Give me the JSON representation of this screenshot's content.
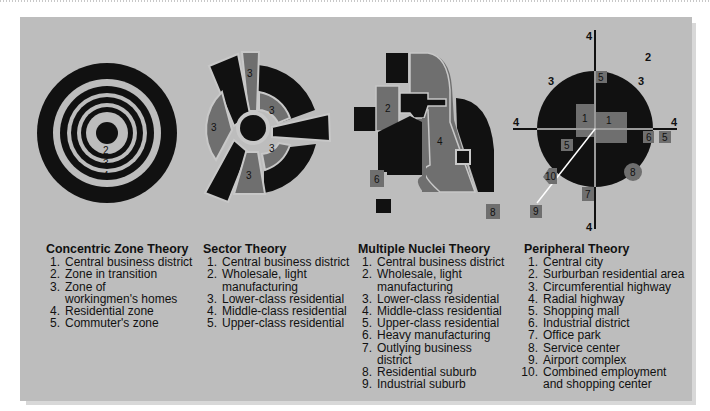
{
  "colors": {
    "panel_bg": "#bdbdbd",
    "dark": "#111111",
    "mid": "#6f6f6f",
    "light_line": "#c8c8c8"
  },
  "diagrams": {
    "concentric": {
      "labels": [
        "1",
        "2",
        "3",
        "4",
        "5"
      ]
    },
    "sector": {
      "labels": [
        "3",
        "3",
        "3",
        "3",
        "3"
      ]
    },
    "nuclei": {
      "labels": [
        "2",
        "4",
        "6",
        "8"
      ]
    },
    "peripheral": {
      "labels": {
        "radial_top": "4",
        "radial_bottom": "4",
        "radial_left": "4",
        "radial_right": "4",
        "suburban": "2",
        "circ_left": "3",
        "circ_right": "3",
        "city_left": "1",
        "city_right": "1",
        "mall_top": "5",
        "mall_inner": "5",
        "mall_right": "5",
        "industrial": "6",
        "office": "7",
        "service": "8",
        "airport": "9",
        "combined": "10"
      }
    }
  },
  "legends": [
    {
      "title": "Concentric Zone Theory",
      "items": [
        {
          "n": "1.",
          "text": "Central business district"
        },
        {
          "n": "2.",
          "text": "Zone in transition"
        },
        {
          "n": "3.",
          "text": "Zone of workingmen's homes"
        },
        {
          "n": "4.",
          "text": "Residential zone"
        },
        {
          "n": "5.",
          "text": "Commuter's zone"
        }
      ]
    },
    {
      "title": "Sector Theory",
      "items": [
        {
          "n": "1.",
          "text": "Central business district"
        },
        {
          "n": "2.",
          "text": "Wholesale, light manufacturing"
        },
        {
          "n": "3.",
          "text": "Lower-class residential"
        },
        {
          "n": "4.",
          "text": "Middle-class residential"
        },
        {
          "n": "5.",
          "text": "Upper-class residential"
        }
      ]
    },
    {
      "title": "Multiple Nuclei Theory",
      "items": [
        {
          "n": "1.",
          "text": "Central business district"
        },
        {
          "n": "2.",
          "text": "Wholesale, light manufacturing"
        },
        {
          "n": "3.",
          "text": "Lower-class residential"
        },
        {
          "n": "4.",
          "text": "Middle-class residential"
        },
        {
          "n": "5.",
          "text": "Upper-class residential"
        },
        {
          "n": "6.",
          "text": "Heavy manufacturing"
        },
        {
          "n": "7.",
          "text": "Outlying business district"
        },
        {
          "n": "8.",
          "text": "Residential suburb"
        },
        {
          "n": "9.",
          "text": "Industrial suburb"
        }
      ]
    },
    {
      "title": "Peripheral Theory",
      "items": [
        {
          "n": "1.",
          "text": "Central city"
        },
        {
          "n": "2.",
          "text": "Surburban residential area"
        },
        {
          "n": "3.",
          "text": "Circumferential highway"
        },
        {
          "n": "4.",
          "text": "Radial highway"
        },
        {
          "n": "5.",
          "text": "Shopping mall"
        },
        {
          "n": "6.",
          "text": "Industrial district"
        },
        {
          "n": "7.",
          "text": "Office park"
        },
        {
          "n": "8.",
          "text": "Service center"
        },
        {
          "n": "9.",
          "text": "Airport complex"
        },
        {
          "n": "10.",
          "text": "Combined employment and shopping center"
        }
      ]
    }
  ]
}
